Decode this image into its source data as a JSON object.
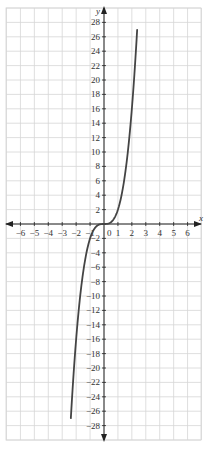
{
  "chart_data": {
    "type": "line",
    "title": "",
    "xlabel": "x",
    "ylabel": "y",
    "xlim": [
      -7,
      7
    ],
    "ylim": [
      -30,
      30
    ],
    "grid": true,
    "legend": null,
    "x_ticks": [
      -6,
      -5,
      -4,
      -3,
      -2,
      -1,
      0,
      1,
      2,
      3,
      4,
      5,
      6
    ],
    "y_ticks": [
      -28,
      -26,
      -24,
      -22,
      -20,
      -18,
      -16,
      -14,
      -12,
      -10,
      -8,
      -6,
      -4,
      -2,
      2,
      4,
      6,
      8,
      10,
      12,
      14,
      16,
      18,
      20,
      22,
      24,
      26,
      28
    ],
    "series": [
      {
        "name": "y = 2x^3",
        "x": [
          -2.38,
          -2.2,
          -2.0,
          -1.8,
          -1.6,
          -1.4,
          -1.2,
          -1.0,
          -0.8,
          -0.6,
          -0.4,
          -0.2,
          0,
          0.2,
          0.4,
          0.6,
          0.8,
          1.0,
          1.2,
          1.4,
          1.6,
          1.8,
          2.0,
          2.2,
          2.38
        ],
        "values": [
          -27,
          -21.3,
          -16,
          -11.7,
          -8.2,
          -5.5,
          -3.5,
          -2,
          -1.0,
          -0.43,
          -0.13,
          -0.02,
          0,
          0.02,
          0.13,
          0.43,
          1.0,
          2,
          3.5,
          5.5,
          8.2,
          11.7,
          16,
          21.3,
          27
        ]
      }
    ]
  },
  "labels": {
    "x_axis": "x",
    "y_axis": "y",
    "origin": "0"
  }
}
